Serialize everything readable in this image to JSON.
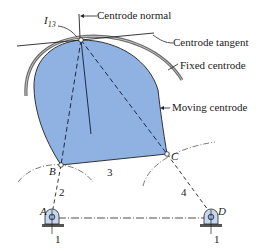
{
  "figure": {
    "labels": {
      "instant_center": "I",
      "instant_center_sub": "13",
      "centrode_normal": "Centrode normal",
      "centrode_tangent": "Centrode tangent",
      "fixed_centrode": "Fixed centrode",
      "moving_centrode": "Moving centrode"
    },
    "joints": {
      "A": "A",
      "B": "B",
      "C": "C",
      "D": "D"
    },
    "links": {
      "ground_left": "1",
      "ground_right": "1",
      "crank": "2",
      "coupler": "3",
      "rocker": "4"
    },
    "colors": {
      "moving_centrode_fill": "#8fb2e3",
      "fixed_centrode_stroke": "#6b6b6b",
      "line": "#222222",
      "ground_hatch": "#555555"
    }
  }
}
